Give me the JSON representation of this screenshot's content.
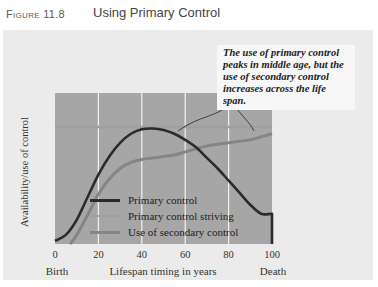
{
  "figure": {
    "label": "Figure 11.8",
    "title": "Using Primary Control"
  },
  "chart_data": {
    "type": "line",
    "title": "Using Primary Control",
    "xlabel": "Lifespan timing in years",
    "ylabel": "Availability/use of control",
    "xlim": [
      0,
      100
    ],
    "ylim": [
      0,
      100
    ],
    "x_ticks": [
      "0",
      "20",
      "40",
      "60",
      "80",
      "100"
    ],
    "x_tick_values": [
      0,
      20,
      40,
      60,
      80,
      100
    ],
    "x_endpoint_labels": {
      "start": "Birth",
      "end": "Death"
    },
    "grid": "vertical",
    "legend_position": "bottom-center",
    "annotation": "The use of primary control peaks in middle age, but the use of secondary control increases across the life span.",
    "series": [
      {
        "name": "Primary control",
        "color": "#2b2b2b",
        "x": [
          0,
          5,
          10,
          15,
          20,
          25,
          30,
          35,
          40,
          45,
          50,
          55,
          60,
          65,
          70,
          75,
          80,
          85,
          90,
          95,
          100,
          100
        ],
        "y": [
          2,
          6,
          16,
          31,
          46,
          58,
          67,
          73,
          76,
          76.5,
          75.5,
          73,
          69,
          64,
          57,
          50,
          42,
          34,
          26,
          20,
          20,
          0
        ]
      },
      {
        "name": "Primary control striving",
        "color": "#a0a0a0",
        "x": [
          0,
          100
        ],
        "y": [
          77.5,
          77.5
        ]
      },
      {
        "name": "Use of secondary control",
        "color": "#858585",
        "x": [
          7,
          10,
          15,
          20,
          25,
          30,
          35,
          40,
          45,
          50,
          55,
          60,
          65,
          70,
          75,
          80,
          85,
          90,
          95,
          100
        ],
        "y": [
          0,
          6,
          19,
          33,
          43,
          50,
          54,
          56,
          57,
          58,
          59,
          61,
          63,
          65,
          66,
          67,
          68,
          69,
          71,
          73
        ]
      }
    ]
  },
  "colors": {
    "plot_bg": "#a6a6a6",
    "panel_bg": "#ebebeb",
    "gridline": "#f2f2f2"
  }
}
